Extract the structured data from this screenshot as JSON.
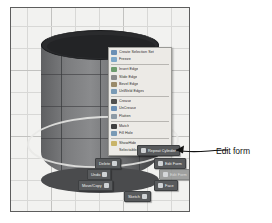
{
  "viewport": {
    "name": "3d-modeling-viewport",
    "background_color": "#f2f2f0",
    "grid_color": "#d8d8d6"
  },
  "model": {
    "shape_label": "Cylinder",
    "body_color": "#7c7d7f",
    "top_face_color": "#2a2b2d",
    "selection_highlight_color": "#e8e8e6"
  },
  "context_menu": {
    "groups": [
      {
        "items": [
          {
            "label": "Create Selection Set",
            "icon": "selection-set-icon",
            "icon_color": "#6b8fb5"
          },
          {
            "label": "Freeze",
            "icon": "freeze-icon",
            "icon_color": "#7fa8c9"
          }
        ]
      },
      {
        "items": [
          {
            "label": "Insert Edge",
            "icon": "insert-edge-icon",
            "icon_color": "#6e9b6e"
          },
          {
            "label": "Slide Edge",
            "icon": "slide-edge-icon",
            "icon_color": "#8a8a8a"
          },
          {
            "label": "Bevel Edge",
            "icon": "bevel-edge-icon",
            "icon_color": "#9a8a6a"
          },
          {
            "label": "UnWeld Edges",
            "icon": "unweld-edges-icon",
            "icon_color": "#7a9ab5"
          }
        ]
      },
      {
        "items": [
          {
            "label": "Crease",
            "icon": "crease-icon",
            "icon_color": "#4f4f4f"
          },
          {
            "label": "UnCrease",
            "icon": "uncrease-icon",
            "icon_color": "#6b8fb5"
          },
          {
            "label": "Flatten",
            "icon": "flatten-icon",
            "icon_color": "#8d9aa5"
          }
        ]
      },
      {
        "items": [
          {
            "label": "Match",
            "icon": "match-icon",
            "icon_color": "#3f3f3f"
          },
          {
            "label": "Fill Hole",
            "icon": "fill-hole-icon",
            "icon_color": "#7a9ab5"
          }
        ]
      },
      {
        "items": [
          {
            "label": "ShowHide",
            "icon": "show-hide-icon",
            "icon_color": "#c9b46a"
          },
          {
            "label": "Selectable/Unselectable",
            "icon": "selectable-icon",
            "icon_color": "#eceae6"
          }
        ]
      }
    ]
  },
  "marking_menu": {
    "buttons": [
      {
        "key": "repeat",
        "label": "Repeat Cylinder",
        "state": "normal"
      },
      {
        "key": "delete",
        "label": "Delete",
        "state": "normal"
      },
      {
        "key": "editform",
        "label": "Edit Form",
        "state": "normal"
      },
      {
        "key": "undo",
        "label": "Undo",
        "state": "normal"
      },
      {
        "key": "editform2",
        "label": "Edit Form",
        "state": "dimmed"
      },
      {
        "key": "movecopy",
        "label": "Move/Copy",
        "state": "normal"
      },
      {
        "key": "face",
        "label": "Face",
        "state": "normal"
      },
      {
        "key": "sketch",
        "label": "Sketch",
        "state": "normal"
      }
    ]
  },
  "annotation": {
    "label": "Edit form",
    "arrow": "leader-arrow-pointing-left"
  },
  "caption": {
    "text": ""
  }
}
